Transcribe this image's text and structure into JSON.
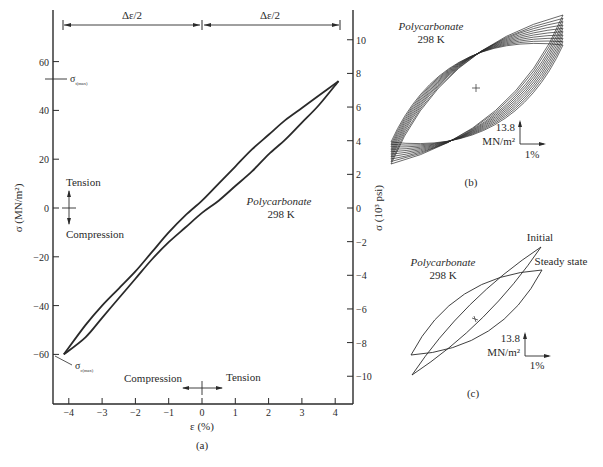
{
  "chart_data": [
    {
      "id": "a",
      "type": "line",
      "panel_label": "(a)",
      "xlabel": "ε (%)",
      "ylabel_left": "σ (MN/m²)",
      "ylabel_right": "σ (10³ psi)",
      "xlim": [
        -4.4,
        4.4
      ],
      "ylim_left": [
        -80,
        78
      ],
      "x_ticks": [
        -4,
        -3,
        -2,
        -1,
        0,
        1,
        2,
        3,
        4
      ],
      "x_tick_labels": [
        "−4",
        "−3",
        "−2",
        "−1",
        "0",
        "1",
        "2",
        "3",
        "4"
      ],
      "y_ticks_left": [
        60,
        40,
        20,
        0,
        -20,
        -40,
        -60
      ],
      "y_tick_labels_left": [
        "60",
        "40",
        "20",
        "0",
        "−20",
        "−40",
        "−60"
      ],
      "y_ticks_right_psi": [
        10,
        8,
        6,
        4,
        2,
        0,
        -2,
        -4,
        -6,
        -8,
        -10
      ],
      "y_tick_labels_right": [
        "10",
        "8",
        "6",
        "4",
        "2",
        "0",
        "−2",
        "−4",
        "−6",
        "−8",
        "−10"
      ],
      "annotations": {
        "material": "Polycarbonate",
        "temperature": "298 K",
        "strain_half_left": "Δε/2",
        "strain_half_right": "Δε/2",
        "sigma_t_max": "σ",
        "sigma_t_max_sub": "t(max)",
        "sigma_c_max": "σ",
        "sigma_c_max_sub": "c(max)",
        "tension_v": "Tension",
        "compression_v": "Compression",
        "tension_h": "Tension",
        "compression_h": "Compression"
      },
      "sigma_t_max_value": 52,
      "sigma_c_max_value": -60,
      "series": [
        {
          "name": "loading (upper branch)",
          "points": [
            [
              -4.15,
              -60
            ],
            [
              -3.5,
              -48
            ],
            [
              -3,
              -40
            ],
            [
              -2.5,
              -33
            ],
            [
              -2,
              -26
            ],
            [
              -1.5,
              -18
            ],
            [
              -1,
              -10
            ],
            [
              -0.5,
              -3
            ],
            [
              0,
              3
            ],
            [
              0.5,
              10
            ],
            [
              1,
              17
            ],
            [
              1.5,
              24
            ],
            [
              2,
              30
            ],
            [
              2.5,
              36
            ],
            [
              3,
              41
            ],
            [
              3.5,
              46
            ],
            [
              4.1,
              52
            ]
          ]
        },
        {
          "name": "unloading (lower branch)",
          "points": [
            [
              4.1,
              52
            ],
            [
              3.5,
              42
            ],
            [
              3,
              35
            ],
            [
              2.5,
              28
            ],
            [
              2,
              22
            ],
            [
              1.5,
              15
            ],
            [
              1,
              9
            ],
            [
              0.5,
              3
            ],
            [
              0,
              -2
            ],
            [
              -0.5,
              -8
            ],
            [
              -1,
              -14
            ],
            [
              -1.5,
              -21
            ],
            [
              -2,
              -29
            ],
            [
              -2.5,
              -37
            ],
            [
              -3,
              -45
            ],
            [
              -3.5,
              -53
            ],
            [
              -4.15,
              -60
            ]
          ]
        }
      ]
    },
    {
      "id": "b",
      "type": "line",
      "panel_label": "(b)",
      "material": "Polycarbonate",
      "temperature": "298 K",
      "scale_stress": "13.8",
      "scale_stress_unit": "MN/m²",
      "scale_strain": "1%",
      "description": "multiple hysteresis loops converging to steady state",
      "loop_count": 10
    },
    {
      "id": "c",
      "type": "line",
      "panel_label": "(c)",
      "material": "Polycarbonate",
      "temperature": "298 K",
      "scale_stress": "13.8",
      "scale_stress_unit": "MN/m²",
      "scale_strain": "1%",
      "series": [
        {
          "name": "Initial"
        },
        {
          "name": "Steady state"
        }
      ]
    }
  ]
}
